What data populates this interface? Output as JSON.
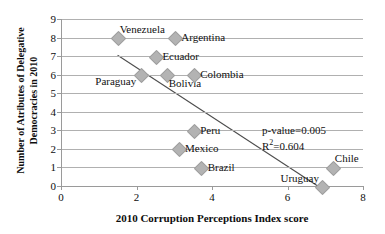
{
  "chart_data": {
    "type": "scatter",
    "title": "",
    "xlabel": "2010 Corruption Perceptions Index score",
    "ylabel": "Number of Atributes of Delegative Democracies in 2010",
    "xlim": [
      0,
      8
    ],
    "ylim": [
      0,
      9
    ],
    "xticks": [
      0,
      2,
      4,
      6,
      8
    ],
    "yticks": [
      0,
      1,
      2,
      3,
      4,
      5,
      6,
      7,
      8,
      9
    ],
    "grid": "horizontal",
    "legend": "none",
    "points": [
      {
        "label": "Venezuela",
        "x": 1.5,
        "y": 8,
        "label_pos": "above-right"
      },
      {
        "label": "Argentina",
        "x": 3.0,
        "y": 8,
        "label_pos": "right"
      },
      {
        "label": "Ecuador",
        "x": 2.5,
        "y": 7,
        "label_pos": "right"
      },
      {
        "label": "Paraguay",
        "x": 2.1,
        "y": 6,
        "label_pos": "below-left"
      },
      {
        "label": "Bolivia",
        "x": 2.8,
        "y": 6,
        "label_pos": "below-right"
      },
      {
        "label": "Colombia",
        "x": 3.5,
        "y": 6,
        "label_pos": "right"
      },
      {
        "label": "Peru",
        "x": 3.5,
        "y": 3,
        "label_pos": "right"
      },
      {
        "label": "Mexico",
        "x": 3.1,
        "y": 2,
        "label_pos": "right"
      },
      {
        "label": "Brazil",
        "x": 3.7,
        "y": 1,
        "label_pos": "right"
      },
      {
        "label": "Chile",
        "x": 7.2,
        "y": 1,
        "label_pos": "above-right"
      },
      {
        "label": "Uruguay",
        "x": 6.9,
        "y": 0,
        "label_pos": "above-left"
      }
    ],
    "trendline": {
      "x_start": 1.5,
      "y_start": 7.05,
      "x_end": 6.8,
      "y_end": 0.0,
      "color": "#4d4d4d"
    },
    "annotations": {
      "p_value": "p-value=0.005",
      "r_squared_prefix": "R",
      "r_squared_sup": "2",
      "r_squared_value": "=0.604"
    },
    "colors": {
      "marker_fill": "#b3b3b3",
      "marker_stroke": "#9d9d9d",
      "gridline": "#b0b0b0",
      "axis": "#9a9a9a",
      "text": "#111111",
      "trendline": "#4d4d4d"
    }
  }
}
